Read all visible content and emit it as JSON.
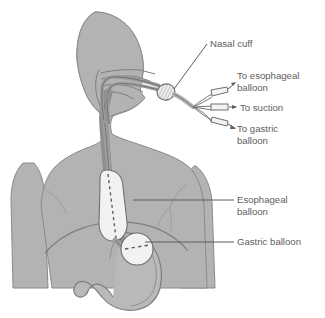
{
  "figure": {
    "type": "medical-illustration",
    "background_color": "#ffffff"
  },
  "colors": {
    "body_fill": "#b3b3b3",
    "body_stroke": "#8a8a8a",
    "organ_fill": "#b9b9b9",
    "organ_stroke": "#7e7e7e",
    "tube_fill": "#a8a8a8",
    "tube_stroke": "#767676",
    "balloon_fill": "#f2f2f2",
    "balloon_stroke": "#6f6f6f",
    "esophagus_fill": "#9a9a9a",
    "leader_line": "#5e5e5e",
    "text": "#5e5e5e",
    "cuff_fill": "#e8e8e8"
  },
  "labels": [
    {
      "id": "nasal-cuff",
      "name": "nasal-cuff-label",
      "lines": [
        "Nasal cuff"
      ],
      "x": 210,
      "y": 47,
      "leader": {
        "from_x": 207,
        "from_y": 44,
        "to_x": 172,
        "to_y": 91
      }
    },
    {
      "id": "to-esophageal-balloon",
      "name": "to-esophageal-balloon-label",
      "lines": [
        "To esophageal",
        "balloon"
      ],
      "x": 237,
      "y": 79,
      "leader": {
        "from_x": 234,
        "from_y": 90,
        "to_x": 222,
        "to_y": 94
      }
    },
    {
      "id": "to-suction",
      "name": "to-suction-label",
      "lines": [
        "To suction"
      ],
      "x": 240,
      "y": 111,
      "leader": {
        "from_x": 236,
        "from_y": 108,
        "to_x": 222,
        "to_y": 108
      }
    },
    {
      "id": "to-gastric-balloon",
      "name": "to-gastric-balloon-label",
      "lines": [
        "To gastric",
        "balloon"
      ],
      "x": 237,
      "y": 129,
      "leader": {
        "from_x": 234,
        "from_y": 123,
        "to_x": 222,
        "to_y": 121
      }
    },
    {
      "id": "esophageal-balloon",
      "name": "esophageal-balloon-label",
      "lines": [
        "Esophageal",
        "balloon"
      ],
      "x": 237,
      "y": 203,
      "leader": {
        "from_x": 234,
        "from_y": 200,
        "to_x": 133,
        "to_y": 200
      }
    },
    {
      "id": "gastric-balloon",
      "name": "gastric-balloon-label",
      "lines": [
        "Gastric balloon"
      ],
      "x": 237,
      "y": 245,
      "leader": {
        "from_x": 234,
        "from_y": 242,
        "to_x": 145,
        "to_y": 242
      }
    }
  ],
  "anatomy": [
    {
      "name": "head-silhouette",
      "description": "lateral head profile facing right"
    },
    {
      "name": "neck-silhouette",
      "description": "neck connecting head to torso"
    },
    {
      "name": "torso-silhouette",
      "description": "upper chest and shoulders"
    },
    {
      "name": "left-arm-silhouette",
      "description": "patient right arm, viewer left"
    },
    {
      "name": "right-arm-silhouette",
      "description": "patient left arm, viewer right"
    },
    {
      "name": "nasal-passage",
      "description": "nasopharynx and oral cavity outlines"
    },
    {
      "name": "esophagus",
      "description": "esophageal lumen descending through neck and chest"
    },
    {
      "name": "stomach",
      "description": "stomach with greater and lesser curvature"
    },
    {
      "name": "diaphragm",
      "description": "diaphragm arc across lower chest"
    },
    {
      "name": "pectoral-contour",
      "description": "faint chest muscle contour lines"
    }
  ],
  "device": [
    {
      "name": "nasal-cuff",
      "description": "hatched oval cuff at nostril where tube enters"
    },
    {
      "name": "tube-bundle",
      "description": "triple-lumen tube exiting nose"
    },
    {
      "name": "esophageal-balloon",
      "description": "elongated inflated capsule in esophagus"
    },
    {
      "name": "gastric-balloon",
      "description": "round inflated balloon in stomach fundus"
    },
    {
      "name": "port-esophageal",
      "description": "connector port for esophageal balloon lumen"
    },
    {
      "name": "port-suction",
      "description": "connector port for gastric suction lumen"
    },
    {
      "name": "port-gastric",
      "description": "connector port for gastric balloon lumen"
    }
  ]
}
